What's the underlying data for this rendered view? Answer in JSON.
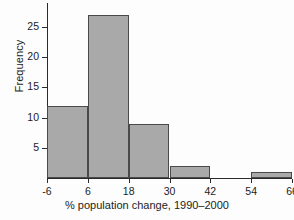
{
  "chart_data": {
    "type": "bar",
    "subtype": "histogram",
    "title": "",
    "xlabel": "% population change, 1990–2000",
    "ylabel": "Frequency",
    "bin_edges": [
      -6,
      6,
      18,
      30,
      42,
      54,
      66
    ],
    "bin_labels": [
      "-6 to 6",
      "6 to 18",
      "18 to 30",
      "30 to 42",
      "42 to 54",
      "54 to 66"
    ],
    "values": [
      12,
      27,
      9,
      2,
      0,
      1
    ],
    "xlim": [
      -6,
      66
    ],
    "ylim": [
      0,
      29
    ],
    "xticks": [
      -6,
      6,
      18,
      30,
      42,
      54,
      66
    ],
    "xtick_labels": [
      "-6",
      "6",
      "18",
      "30",
      "42",
      "54",
      "66"
    ],
    "yticks": [
      5,
      10,
      15,
      20,
      25
    ],
    "ytick_labels": [
      "5",
      "10",
      "15",
      "20",
      "25"
    ],
    "grid": false,
    "legend": null,
    "bar_fill_color": "#a9a9a9",
    "bar_edge_color": "#4a4a4a",
    "axis_color": "#2a2a2a",
    "background_color": "#fdfdfd"
  }
}
